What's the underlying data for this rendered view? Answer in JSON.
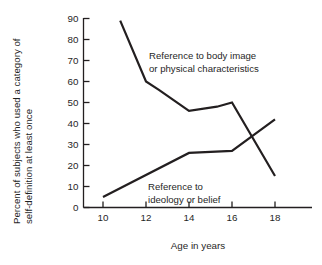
{
  "chart_data": {
    "type": "line",
    "title": "",
    "xlabel": "Age in years",
    "ylabel": "Percent of subjects who used a category of self-definition at least once",
    "ylabel_line1": "Percent of subjects who used a category of",
    "ylabel_line2": "self-definition at least once",
    "xlim": [
      9,
      19.2
    ],
    "ylim": [
      0,
      92
    ],
    "xticks": [
      10,
      12,
      14,
      16,
      18
    ],
    "xtick_labels": [
      "10",
      "12",
      "14",
      "16",
      "18"
    ],
    "yticks": [
      0,
      10,
      20,
      30,
      40,
      50,
      60,
      70,
      80,
      90
    ],
    "ytick_labels": [
      "0",
      "10",
      "20",
      "30",
      "40",
      "50",
      "60",
      "70",
      "80",
      "90"
    ],
    "grid": false,
    "legend_position": "inline-annotation",
    "line_color": "#231f20",
    "axis_color": "#231f20",
    "series": [
      {
        "name": "Reference to body image or physical characteristics",
        "annotation_line1": "Reference to body image",
        "annotation_line2": "or physical characteristics",
        "x": [
          10.8,
          12.0,
          12.6,
          14.0,
          15.3,
          16.0,
          18.0
        ],
        "values": [
          89,
          60,
          56,
          46,
          48,
          50,
          15
        ]
      },
      {
        "name": "Reference to ideology or belief",
        "annotation_line1": "Reference to",
        "annotation_line2": "ideology or belief",
        "x": [
          10.0,
          14.0,
          16.0,
          18.0
        ],
        "values": [
          5,
          26,
          27,
          42
        ]
      }
    ]
  }
}
